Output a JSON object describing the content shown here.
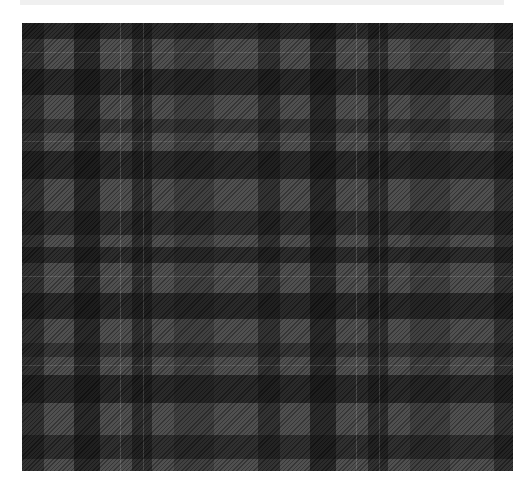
{
  "caption": {
    "text": "",
    "note": "clipped caption line; only descenders visible"
  },
  "image": {
    "subject": "grey and black tartan plaid fabric pattern",
    "colors": {
      "light_grey": "#5a5a5a",
      "mid_grey": "#4a4a4a",
      "twill_grey": "#3a3a3a",
      "dark": "#1c1c1c",
      "pinstripe": "#8a8a8a",
      "caption_bg": "#f0f0f0"
    }
  }
}
